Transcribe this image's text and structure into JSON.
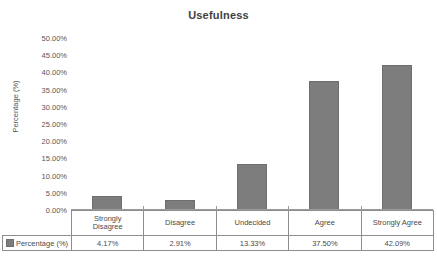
{
  "chart_data": {
    "type": "bar",
    "title": "Usefulness",
    "xlabel": "",
    "ylabel": "Percentage (%)",
    "categories": [
      "Strongly Disagree",
      "Disagree",
      "Undecided",
      "Agree",
      "Strongly Agree"
    ],
    "category_lines": [
      [
        "Strongly",
        "Disagree"
      ],
      [
        "Disagree"
      ],
      [
        "Undecided"
      ],
      [
        "Agree"
      ],
      [
        "Strongly Agree"
      ]
    ],
    "values": [
      4.17,
      2.91,
      13.33,
      37.5,
      42.09
    ],
    "value_labels": [
      "4.17%",
      "2.91%",
      "13.33%",
      "37.50%",
      "42.09%"
    ],
    "series": [
      {
        "name": "Percentage (%)",
        "values": [
          4.17,
          2.91,
          13.33,
          37.5,
          42.09
        ],
        "color": "#7d7d7d"
      }
    ],
    "ylim": [
      0,
      50
    ],
    "ytick_step": 5,
    "ytick_labels": [
      "50.00%",
      "45.00%",
      "40.00%",
      "35.00%",
      "30.00%",
      "25.00%",
      "20.00%",
      "15.00%",
      "10.00%",
      "5.00%",
      "0.00%"
    ],
    "ytick_values": [
      50,
      45,
      40,
      35,
      30,
      25,
      20,
      15,
      10,
      5,
      0
    ],
    "grid": false,
    "legend": {
      "position": "bottom-table",
      "entries": [
        {
          "label": "Percentage (%)",
          "color": "#7d7d7d"
        }
      ]
    },
    "data_table": {
      "row_label": "Percentage (%)",
      "columns": [
        "Strongly Disagree",
        "Disagree",
        "Undecided",
        "Agree",
        "Strongly Agree"
      ],
      "values": [
        "4.17%",
        "2.91%",
        "13.33%",
        "37.50%",
        "42.09%"
      ]
    }
  },
  "caption": ""
}
